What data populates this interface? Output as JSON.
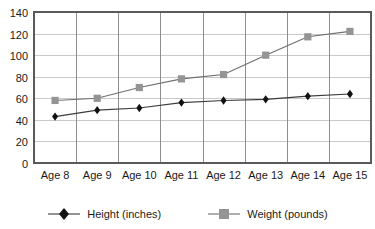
{
  "chart_data": {
    "type": "line",
    "title": "",
    "subtitle": "",
    "xlabel": "",
    "ylabel": "",
    "categories": [
      "Age 8",
      "Age 9",
      "Age 10",
      "Age 11",
      "Age 12",
      "Age 13",
      "Age 14",
      "Age 15"
    ],
    "series": [
      {
        "name": "Height (inches)",
        "values": [
          43,
          49,
          51,
          56,
          58,
          59,
          62,
          64
        ],
        "color": "#111111",
        "line_color": "#3c3c3c",
        "marker": "diamond"
      },
      {
        "name": "Weight (pounds)",
        "values": [
          58,
          60,
          70,
          78,
          82,
          100,
          117,
          122
        ],
        "color": "#949494",
        "line_color": "#6e6e6e",
        "marker": "square"
      }
    ],
    "ylim": [
      0,
      140
    ],
    "ytick_step": 20,
    "yticks": [
      0,
      20,
      40,
      60,
      80,
      100,
      120,
      140
    ],
    "ytick_labels": [
      "0",
      "20",
      "40",
      "60",
      "80",
      "100",
      "120",
      "140"
    ],
    "grid": {
      "horizontal": true,
      "vertical": true,
      "horizontal_color": "#c9c9c9",
      "vertical_color": "#8e8e8e"
    },
    "legend": {
      "position": "bottom",
      "orientation": "horizontal",
      "entries": [
        "Height (inches)",
        "Weight (pounds)"
      ]
    },
    "plot_border_color": "#5a5a5a",
    "background": "#ffffff"
  }
}
